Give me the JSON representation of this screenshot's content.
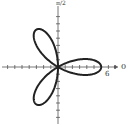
{
  "chart_data": {
    "type": "line",
    "title": "",
    "subtitle": "",
    "equation": "r = 6cos(3θ)",
    "coordinate_system": "polar",
    "petals": 3,
    "max_radius": 6,
    "xlabel": "0",
    "ylabel": "π/2",
    "tick_labels": [
      "6"
    ],
    "axis_range": [
      -6,
      6
    ],
    "grid": false,
    "legend": null,
    "series": [
      {
        "name": "rose",
        "theta_range": [
          0,
          3.14159
        ],
        "r_formula": "6*cos(3*theta)"
      }
    ]
  },
  "labels": {
    "top_axis": "π/2",
    "right_axis": "0",
    "tick_6": "6"
  },
  "colors": {
    "curve": "#222222",
    "axes": "#555555"
  }
}
